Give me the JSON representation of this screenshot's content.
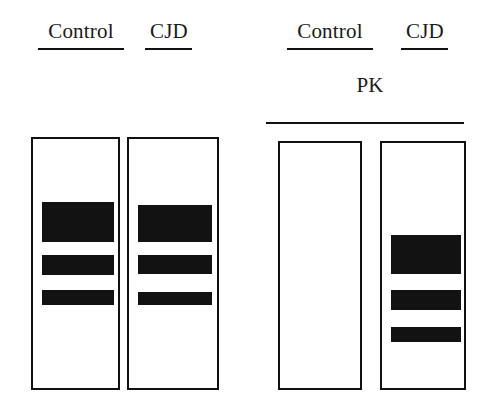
{
  "figure": {
    "type": "western-blot-gel-schematic",
    "width": 492,
    "height": 416,
    "background_color": "#ffffff",
    "ink_color": "#111111",
    "band_color": "#121212"
  },
  "groups": [
    {
      "id": "untreated-group",
      "name": "untreated",
      "treatment_label": "",
      "lanes": [
        {
          "id": "lane-1",
          "label": "Control",
          "label_underlined": true,
          "box": {
            "x": 31,
            "y": 137,
            "w": 89,
            "h": 253
          },
          "label_box": {
            "x": 36,
            "y": 19,
            "w": 90,
            "h": 27
          },
          "underline": {
            "x": 38,
            "y": 48,
            "w": 86
          },
          "bands": [
            {
              "name": "band-upper",
              "x": 9,
              "y": 63,
              "w": 72,
              "h": 40
            },
            {
              "name": "band-middle",
              "x": 9,
              "y": 116,
              "w": 72,
              "h": 20
            },
            {
              "name": "band-lower",
              "x": 9,
              "y": 151,
              "w": 72,
              "h": 15
            }
          ]
        },
        {
          "id": "lane-2",
          "label": "CJD",
          "label_underlined": true,
          "box": {
            "x": 127,
            "y": 137,
            "w": 92,
            "h": 253
          },
          "label_box": {
            "x": 143,
            "y": 19,
            "w": 52,
            "h": 27
          },
          "underline": {
            "x": 145,
            "y": 48,
            "w": 47
          },
          "bands": [
            {
              "name": "band-upper",
              "x": 9,
              "y": 66,
              "w": 74,
              "h": 37
            },
            {
              "name": "band-middle",
              "x": 9,
              "y": 116,
              "w": 74,
              "h": 19
            },
            {
              "name": "band-lower",
              "x": 9,
              "y": 153,
              "w": 74,
              "h": 13
            }
          ]
        }
      ]
    },
    {
      "id": "pk-treated-group",
      "name": "proteinase-K-treated",
      "treatment_label": "PK",
      "treatment_label_box": {
        "x": 300,
        "y": 73,
        "w": 140,
        "h": 26
      },
      "treatment_rule": {
        "x": 266,
        "y": 122,
        "w": 198
      },
      "lanes": [
        {
          "id": "lane-3",
          "label": "Control",
          "label_underlined": true,
          "box": {
            "x": 278,
            "y": 141,
            "w": 84,
            "h": 249
          },
          "label_box": {
            "x": 285,
            "y": 19,
            "w": 90,
            "h": 27
          },
          "underline": {
            "x": 287,
            "y": 48,
            "w": 86
          },
          "bands": []
        },
        {
          "id": "lane-4",
          "label": "CJD",
          "label_underlined": true,
          "box": {
            "x": 380,
            "y": 141,
            "w": 86,
            "h": 249
          },
          "label_box": {
            "x": 399,
            "y": 19,
            "w": 52,
            "h": 27
          },
          "underline": {
            "x": 401,
            "y": 48,
            "w": 47
          },
          "bands": [
            {
              "name": "band-upper",
              "x": 9,
              "y": 92,
              "w": 70,
              "h": 39
            },
            {
              "name": "band-middle",
              "x": 9,
              "y": 147,
              "w": 70,
              "h": 20
            },
            {
              "name": "band-lower",
              "x": 9,
              "y": 184,
              "w": 70,
              "h": 15
            }
          ]
        }
      ]
    }
  ]
}
